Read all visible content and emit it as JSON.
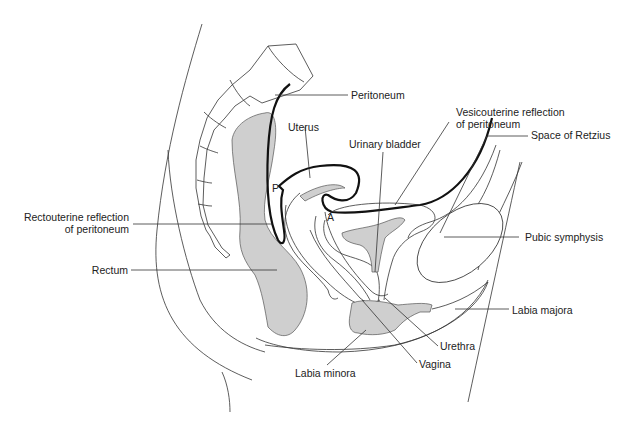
{
  "diagram": {
    "labels": {
      "peritoneum": "Peritoneum",
      "uterus": "Uterus",
      "urinary_bladder": "Urinary bladder",
      "vesicouterine_1": "Vesicouterine reflection",
      "vesicouterine_2": "of peritoneum",
      "space_of_retzius": "Space of Retzius",
      "rectouterine_1": "Rectouterine reflection",
      "rectouterine_2": "of peritoneum",
      "rectum": "Rectum",
      "pubic_symphysis": "Pubic symphysis",
      "labia_majora": "Labia majora",
      "urethra": "Urethra",
      "vagina": "Vagina",
      "labia_minora": "Labia minora",
      "marker_p": "P",
      "marker_a": "A"
    },
    "colors": {
      "shaded_tissue": "#cfcfcf",
      "line": "#333333",
      "peritoneum_line": "#111111"
    }
  }
}
